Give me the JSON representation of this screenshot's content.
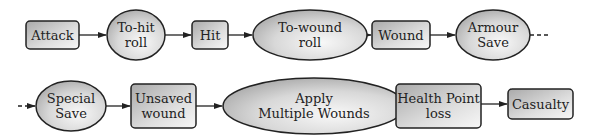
{
  "diagram": {
    "type": "flowchart",
    "rows": [
      {
        "nodes": [
          {
            "id": "attack",
            "shape": "rect",
            "lines": [
              "Attack"
            ]
          },
          {
            "id": "to-hit-roll",
            "shape": "ellipse",
            "lines": [
              "To-hit",
              "roll"
            ]
          },
          {
            "id": "hit",
            "shape": "rect",
            "lines": [
              "Hit"
            ]
          },
          {
            "id": "to-wound-roll",
            "shape": "ellipse",
            "lines": [
              "To-wound",
              "roll"
            ]
          },
          {
            "id": "wound",
            "shape": "rect",
            "lines": [
              "Wound"
            ]
          },
          {
            "id": "armour-save",
            "shape": "ellipse",
            "lines": [
              "Armour",
              "Save"
            ]
          }
        ],
        "continues": true
      },
      {
        "nodes": [
          {
            "id": "special-save",
            "shape": "ellipse",
            "lines": [
              "Special",
              "Save"
            ]
          },
          {
            "id": "unsaved-wound",
            "shape": "rect",
            "lines": [
              "Unsaved",
              "wound"
            ]
          },
          {
            "id": "apply-multiple-wounds",
            "shape": "ellipse",
            "lines": [
              "Apply",
              "Multiple Wounds"
            ]
          },
          {
            "id": "health-point-loss",
            "shape": "rect",
            "lines": [
              "Health Point",
              "loss"
            ]
          },
          {
            "id": "casualty",
            "shape": "rect",
            "lines": [
              "Casualty"
            ]
          }
        ],
        "continued": true
      }
    ],
    "edges": [
      [
        "attack",
        "to-hit-roll"
      ],
      [
        "to-hit-roll",
        "hit"
      ],
      [
        "hit",
        "to-wound-roll"
      ],
      [
        "to-wound-roll",
        "wound"
      ],
      [
        "wound",
        "armour-save"
      ],
      [
        "armour-save",
        "special-save"
      ],
      [
        "special-save",
        "unsaved-wound"
      ],
      [
        "unsaved-wound",
        "apply-multiple-wounds"
      ],
      [
        "apply-multiple-wounds",
        "health-point-loss"
      ],
      [
        "health-point-loss",
        "casualty"
      ]
    ],
    "colors": {
      "stroke": "#222222",
      "fill_light": "#f4f4f4",
      "fill_dark": "#a8a8a8",
      "text": "#222222"
    }
  }
}
